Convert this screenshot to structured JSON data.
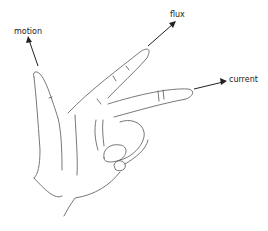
{
  "diagram": {
    "labels": {
      "motion": "motion",
      "flux": "flux",
      "current": "current"
    },
    "colors": {
      "background": "#ffffff",
      "line": "#555555",
      "text": "#222222"
    }
  }
}
